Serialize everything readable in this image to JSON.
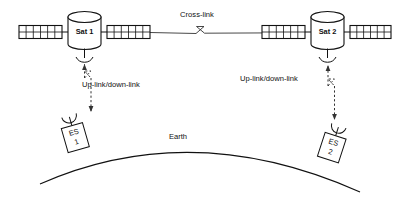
{
  "diagram": {
    "background_color": "#ffffff",
    "line_color": "#111111",
    "satellites": [
      {
        "id": "sat-1",
        "label": "Sat 1",
        "x": 85,
        "y": 32
      },
      {
        "id": "sat-2",
        "label": "Sat 2",
        "x": 327,
        "y": 32
      }
    ],
    "ground_stations": [
      {
        "id": "es-1",
        "label_line1": "ES",
        "label_line2": "1",
        "x": 76,
        "y": 136
      },
      {
        "id": "es-2",
        "label_line1": "ES",
        "label_line2": "2",
        "x": 320,
        "y": 146
      }
    ],
    "links": [
      {
        "id": "cross-link",
        "label": "Cross-link",
        "style": "solid",
        "arrows": "both",
        "label_x": 197,
        "label_y": 15
      },
      {
        "id": "uplink-downlink-left",
        "label": "Up-link/down-link",
        "style": "dashed",
        "arrows": "both",
        "label_x": 82,
        "label_y": 85
      },
      {
        "id": "uplink-downlink-right",
        "label": "Up-link/down-link",
        "style": "dashed",
        "arrows": "both",
        "label_x": 240,
        "label_y": 79
      }
    ],
    "earth": {
      "label": "Earth",
      "label_x": 178,
      "label_y": 137
    },
    "solar_panel": {
      "rows": 2,
      "cols": 6
    }
  }
}
